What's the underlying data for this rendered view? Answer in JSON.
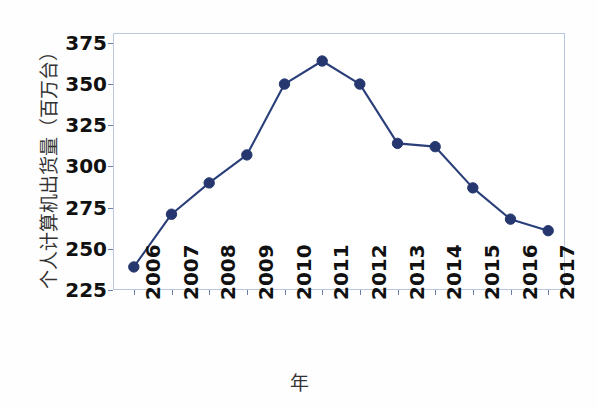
{
  "chart_data": {
    "type": "line",
    "title": "",
    "xlabel": "年",
    "ylabel": "个人计算机出货量（百万台）",
    "categories": [
      "2006",
      "2007",
      "2008",
      "2009",
      "2010",
      "2011",
      "2012",
      "2013",
      "2014",
      "2015",
      "2016",
      "2017"
    ],
    "values": [
      239,
      271,
      290,
      307,
      350,
      364,
      350,
      314,
      312,
      287,
      268,
      261
    ],
    "series": [
      {
        "name": "个人计算机出货量",
        "values": [
          239,
          271,
          290,
          307,
          350,
          364,
          350,
          314,
          312,
          287,
          268,
          261
        ]
      }
    ],
    "ylim": [
      225,
      381
    ],
    "y_ticks": [
      "225",
      "250",
      "275",
      "300",
      "325",
      "350",
      "375"
    ],
    "y_tick_values": [
      225,
      250,
      275,
      300,
      325,
      350,
      375
    ],
    "xlim": [
      "2006",
      "2017"
    ],
    "grid": false,
    "legend": false,
    "legend_position": "none",
    "marker": "circle",
    "line_color": "#2a3f7a",
    "marker_color": "#25376e",
    "frame_color": "#b9c7e2",
    "background_color": "#ffffff"
  },
  "axes": {
    "y_title": "个人计算机出货量（百万台）",
    "x_title": "年",
    "y_tick_labels": [
      "375",
      "350",
      "325",
      "300",
      "275",
      "250",
      "225"
    ],
    "x_tick_labels": [
      "2006",
      "2007",
      "2008",
      "2009",
      "2010",
      "2011",
      "2012",
      "2013",
      "2014",
      "2015",
      "2016",
      "2017"
    ]
  }
}
